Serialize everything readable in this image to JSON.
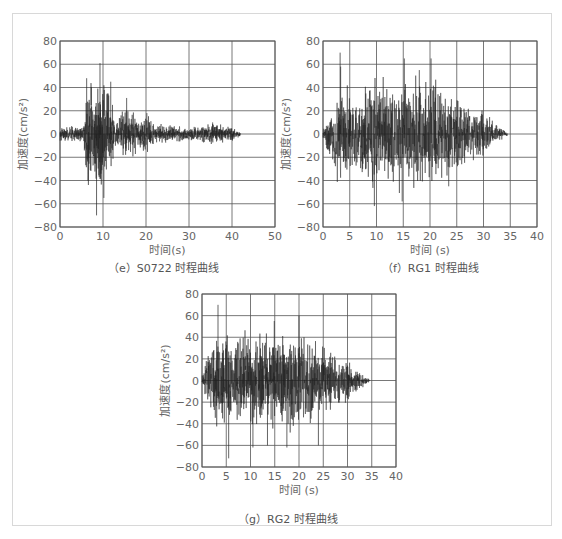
{
  "chart_data": [
    {
      "id": "e",
      "type": "line",
      "title": "（e）S0722 时程曲线",
      "caption": "（e）S0722 时程曲线",
      "xlabel": "时间(s)",
      "ylabel": "加速度(cm/s²)",
      "xlim": [
        0,
        50
      ],
      "ylim": [
        -80,
        80
      ],
      "xticks": [
        0,
        10,
        20,
        30,
        40,
        50
      ],
      "yticks": [
        80,
        60,
        40,
        20,
        0,
        -20,
        -40,
        -60,
        -80
      ],
      "ytick_labels": [
        "80",
        "60",
        "40",
        "20",
        "0",
        "−20",
        "−40",
        "−60",
        "−80"
      ],
      "grid": true,
      "duration": 42,
      "envelope": [
        [
          0,
          6
        ],
        [
          5.5,
          8
        ],
        [
          6,
          48
        ],
        [
          8,
          55
        ],
        [
          9,
          60
        ],
        [
          11,
          45
        ],
        [
          12,
          30
        ],
        [
          13,
          15
        ],
        [
          15,
          25
        ],
        [
          17,
          25
        ],
        [
          18,
          12
        ],
        [
          20,
          18
        ],
        [
          22,
          10
        ],
        [
          30,
          6
        ],
        [
          36,
          10
        ],
        [
          40,
          6
        ],
        [
          42,
          2
        ]
      ],
      "peaks": [
        [
          6.2,
          48
        ],
        [
          8.5,
          -70
        ],
        [
          9.3,
          61
        ],
        [
          10.2,
          -55
        ],
        [
          11.8,
          45
        ],
        [
          15.5,
          31
        ],
        [
          20.2,
          18
        ],
        [
          35.5,
          10
        ]
      ],
      "series": [
        {
          "name": "S0722",
          "color": "#222222"
        }
      ]
    },
    {
      "id": "f",
      "type": "line",
      "title": "（f）RG1 时程曲线",
      "caption": "（f）RG1 时程曲线",
      "xlabel": "时间 (s)",
      "ylabel": "加速度(cm/s²)",
      "xlim": [
        0,
        40
      ],
      "ylim": [
        -80,
        80
      ],
      "xticks": [
        0,
        5,
        10,
        15,
        20,
        25,
        30,
        35,
        40
      ],
      "yticks": [
        80,
        60,
        40,
        20,
        0,
        -20,
        -40,
        -60,
        -80
      ],
      "ytick_labels": [
        "80",
        "60",
        "40",
        "20",
        "0",
        "−20",
        "−40",
        "−60",
        "−80"
      ],
      "grid": true,
      "duration": 34.5,
      "envelope": [
        [
          0,
          5
        ],
        [
          1.5,
          30
        ],
        [
          3,
          50
        ],
        [
          6,
          48
        ],
        [
          10,
          50
        ],
        [
          15,
          55
        ],
        [
          20,
          55
        ],
        [
          24,
          40
        ],
        [
          27,
          30
        ],
        [
          30,
          22
        ],
        [
          32,
          12
        ],
        [
          34.5,
          2
        ]
      ],
      "peaks": [
        [
          3.2,
          70
        ],
        [
          3.3,
          58
        ],
        [
          9.6,
          -62
        ],
        [
          15.2,
          65
        ],
        [
          14.8,
          -58
        ],
        [
          20.2,
          65
        ],
        [
          18.0,
          55
        ],
        [
          23.5,
          -45
        ]
      ],
      "series": [
        {
          "name": "RG1",
          "color": "#222222"
        }
      ]
    },
    {
      "id": "g",
      "type": "line",
      "title": "（g）RG2 时程曲线",
      "caption": "（g）RG2 时程曲线",
      "xlabel": "时间 (s)",
      "ylabel": "加速度(cm/s²)",
      "xlim": [
        0,
        40
      ],
      "ylim": [
        -80,
        80
      ],
      "xticks": [
        0,
        5,
        10,
        15,
        20,
        25,
        30,
        35,
        40
      ],
      "yticks": [
        80,
        60,
        40,
        20,
        0,
        -20,
        -40,
        -60,
        -80
      ],
      "ytick_labels": [
        "80",
        "60",
        "40",
        "20",
        "0",
        "−20",
        "−40",
        "−60",
        "−80"
      ],
      "grid": true,
      "duration": 34.5,
      "envelope": [
        [
          0,
          5
        ],
        [
          1.5,
          30
        ],
        [
          3,
          50
        ],
        [
          6,
          48
        ],
        [
          10,
          48
        ],
        [
          15,
          52
        ],
        [
          20,
          50
        ],
        [
          24,
          42
        ],
        [
          27,
          30
        ],
        [
          30,
          20
        ],
        [
          32,
          12
        ],
        [
          34.5,
          2
        ]
      ],
      "peaks": [
        [
          3.3,
          70
        ],
        [
          5.5,
          -72
        ],
        [
          10.5,
          -62
        ],
        [
          14.9,
          55
        ],
        [
          13.5,
          -60
        ],
        [
          20.0,
          60
        ],
        [
          17.5,
          -62
        ],
        [
          24.0,
          -60
        ]
      ],
      "series": [
        {
          "name": "RG2",
          "color": "#222222"
        }
      ]
    }
  ],
  "layout": {
    "e": {
      "plot": [
        60,
        41,
        215,
        186
      ],
      "caption_pos": [
        108,
        259
      ]
    },
    "f": {
      "plot": [
        323,
        41,
        214,
        186
      ],
      "caption_pos": [
        382,
        259
      ]
    },
    "g": {
      "plot": [
        202,
        294,
        194,
        173
      ],
      "caption_pos": [
        238,
        510
      ]
    }
  }
}
